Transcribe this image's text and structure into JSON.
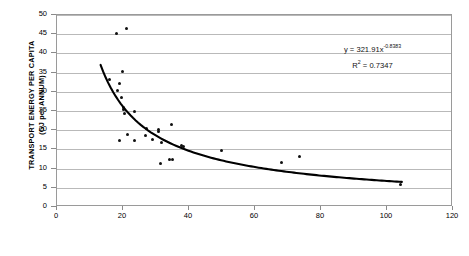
{
  "chart_data": {
    "type": "scatter",
    "title": "",
    "xlabel": "ACTIVITY INTENSITY (PERSONS + JOBS PER HA)",
    "ylabel_line1": "TRANSPORT ENERGY PER CAPITA",
    "ylabel_line2": "(GJ per ANNUM)",
    "xlim": [
      0,
      120
    ],
    "ylim": [
      0,
      50
    ],
    "xticks": [
      0,
      20,
      40,
      60,
      80,
      100,
      120
    ],
    "yticks": [
      0,
      5,
      10,
      15,
      20,
      25,
      30,
      35,
      40,
      45,
      50
    ],
    "grid": "horizontal",
    "legend": "none",
    "marker_color": "#101010",
    "trendline_color": "#000000",
    "gridline_color": "#b9b9b9",
    "points": [
      {
        "x": 18.0,
        "y": 45.3
      },
      {
        "x": 21.0,
        "y": 46.4
      },
      {
        "x": 19.8,
        "y": 35.4
      },
      {
        "x": 16.0,
        "y": 33.1
      },
      {
        "x": 18.8,
        "y": 32.1
      },
      {
        "x": 18.3,
        "y": 30.4
      },
      {
        "x": 19.5,
        "y": 28.4
      },
      {
        "x": 20.0,
        "y": 25.9
      },
      {
        "x": 20.3,
        "y": 25.4
      },
      {
        "x": 20.6,
        "y": 24.4
      },
      {
        "x": 23.6,
        "y": 24.8
      },
      {
        "x": 27.0,
        "y": 20.4
      },
      {
        "x": 30.8,
        "y": 20.1
      },
      {
        "x": 30.9,
        "y": 19.6
      },
      {
        "x": 34.6,
        "y": 21.5
      },
      {
        "x": 21.4,
        "y": 18.9
      },
      {
        "x": 26.8,
        "y": 18.6
      },
      {
        "x": 18.9,
        "y": 17.2
      },
      {
        "x": 23.6,
        "y": 17.4
      },
      {
        "x": 28.8,
        "y": 17.6
      },
      {
        "x": 31.6,
        "y": 16.9
      },
      {
        "x": 37.8,
        "y": 15.9
      },
      {
        "x": 38.2,
        "y": 15.7
      },
      {
        "x": 31.4,
        "y": 11.3
      },
      {
        "x": 34.2,
        "y": 12.3
      },
      {
        "x": 35.1,
        "y": 12.3
      },
      {
        "x": 49.8,
        "y": 14.6
      },
      {
        "x": 73.5,
        "y": 13.2
      },
      {
        "x": 68.0,
        "y": 11.5
      },
      {
        "x": 104.2,
        "y": 5.8
      }
    ],
    "trendline": {
      "type": "power",
      "coefficient": 321.91,
      "exponent": -0.8383,
      "r_squared": 0.7347,
      "x_start": 13.2,
      "x_end": 104.5,
      "equation_text": "y = 321.91x",
      "equation_exponent": "-0.8383",
      "r2_prefix": "R",
      "r2_sup": "2",
      "r2_value": " = 0.7347"
    }
  }
}
